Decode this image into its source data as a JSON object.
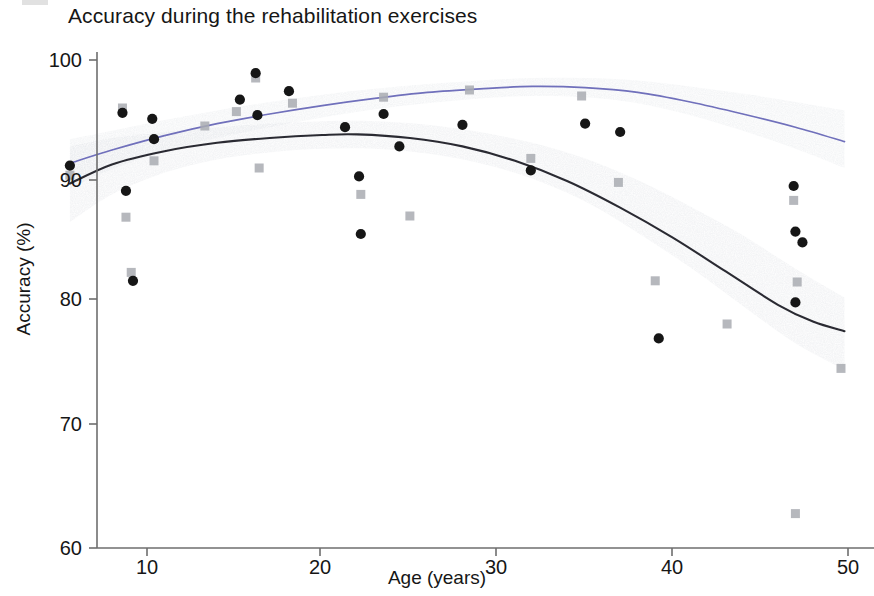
{
  "figure": {
    "title": "Accuracy during the rehabilitation exercises",
    "background_color": "#ffffff"
  },
  "axes": {
    "x_label": "Age (years)",
    "y_label": "Accuracy (%)",
    "x_ticks": [
      "10",
      "20",
      "30",
      "40",
      "50"
    ],
    "y_ticks": [
      "100",
      "90",
      "80",
      "70",
      "60"
    ]
  },
  "colors": {
    "curve_primary": "#2b2b33",
    "curve_secondary": "#6f6fbb",
    "band_fill": "#dfe2e6",
    "marker_circle": "#141414",
    "marker_square": "#a9acb1",
    "axis": "#6e6e6e"
  },
  "chart_data": {
    "type": "scatter",
    "title": "Accuracy during the rehabilitation exercises",
    "xlabel": "Age (years)",
    "ylabel": "Accuracy (%)",
    "xlim": [
      5,
      50.5
    ],
    "ylim": [
      60,
      101
    ],
    "x_ticks": [
      10,
      20,
      30,
      40,
      50
    ],
    "y_ticks": [
      60,
      70,
      80,
      90,
      100
    ],
    "grid": false,
    "legend": "none",
    "series": [
      {
        "name": "Group A (circles)",
        "marker": "circle",
        "color": "#141414",
        "points": [
          [
            5.6,
            91.2
          ],
          [
            8.6,
            95.6
          ],
          [
            8.8,
            89.1
          ],
          [
            9.2,
            81.6
          ],
          [
            10.3,
            95.1
          ],
          [
            10.4,
            93.4
          ],
          [
            15.3,
            96.7
          ],
          [
            16.2,
            98.9
          ],
          [
            16.3,
            95.4
          ],
          [
            18.1,
            97.4
          ],
          [
            21.3,
            94.4
          ],
          [
            22.1,
            90.3
          ],
          [
            22.2,
            85.5
          ],
          [
            23.5,
            95.5
          ],
          [
            24.4,
            92.8
          ],
          [
            28.0,
            94.6
          ],
          [
            31.9,
            90.8
          ],
          [
            35.0,
            94.7
          ],
          [
            37.0,
            94.0
          ],
          [
            39.2,
            76.8
          ],
          [
            46.9,
            89.5
          ],
          [
            47.0,
            85.7
          ],
          [
            47.4,
            84.8
          ],
          [
            47.0,
            79.8
          ]
        ]
      },
      {
        "name": "Group B (squares)",
        "marker": "square",
        "color": "#a9acb1",
        "points": [
          [
            5.6,
            90.4
          ],
          [
            8.6,
            96.0
          ],
          [
            8.8,
            86.9
          ],
          [
            9.1,
            82.3
          ],
          [
            10.4,
            91.6
          ],
          [
            13.3,
            94.5
          ],
          [
            15.1,
            95.7
          ],
          [
            16.2,
            98.5
          ],
          [
            16.4,
            91.0
          ],
          [
            18.3,
            96.4
          ],
          [
            22.2,
            88.8
          ],
          [
            23.5,
            96.9
          ],
          [
            25.0,
            87.0
          ],
          [
            28.4,
            97.5
          ],
          [
            31.9,
            91.8
          ],
          [
            34.8,
            97.0
          ],
          [
            36.9,
            89.8
          ],
          [
            39.0,
            81.6
          ],
          [
            43.1,
            78.0
          ],
          [
            46.9,
            88.3
          ],
          [
            47.1,
            81.5
          ],
          [
            49.6,
            74.3
          ],
          [
            47.0,
            62.2
          ]
        ]
      }
    ],
    "fits": [
      {
        "name": "Primary fit (quadratic)",
        "color": "#2b2b33",
        "points": [
          [
            5.6,
            89.7
          ],
          [
            8,
            91.3
          ],
          [
            11,
            92.4
          ],
          [
            14,
            93.1
          ],
          [
            17,
            93.5
          ],
          [
            20,
            93.75
          ],
          [
            22,
            93.8
          ],
          [
            25,
            93.5
          ],
          [
            28,
            92.8
          ],
          [
            31,
            91.6
          ],
          [
            34,
            89.9
          ],
          [
            37,
            87.7
          ],
          [
            40,
            85.2
          ],
          [
            43,
            82.4
          ],
          [
            46,
            79.6
          ],
          [
            48,
            78.2
          ],
          [
            49.8,
            77.4
          ]
        ],
        "band_upper": [
          [
            5.6,
            92.8
          ],
          [
            8,
            93.5
          ],
          [
            11,
            94.0
          ],
          [
            14,
            94.4
          ],
          [
            17,
            94.7
          ],
          [
            20,
            94.9
          ],
          [
            23,
            94.9
          ],
          [
            26,
            94.6
          ],
          [
            29,
            94.0
          ],
          [
            32,
            93.1
          ],
          [
            35,
            91.8
          ],
          [
            38,
            90.0
          ],
          [
            41,
            87.8
          ],
          [
            44,
            85.4
          ],
          [
            47,
            82.6
          ],
          [
            49.8,
            80.2
          ]
        ],
        "band_lower": [
          [
            5.6,
            86.5
          ],
          [
            8,
            88.8
          ],
          [
            11,
            90.6
          ],
          [
            14,
            91.7
          ],
          [
            17,
            92.3
          ],
          [
            20,
            92.6
          ],
          [
            23,
            92.6
          ],
          [
            26,
            92.2
          ],
          [
            29,
            91.4
          ],
          [
            32,
            90.1
          ],
          [
            35,
            88.2
          ],
          [
            38,
            85.6
          ],
          [
            41,
            82.7
          ],
          [
            44,
            79.5
          ],
          [
            47,
            76.4
          ],
          [
            49.8,
            74.2
          ]
        ]
      },
      {
        "name": "Secondary fit (quadratic)",
        "color": "#6f6fbb",
        "points": [
          [
            5.6,
            91.4
          ],
          [
            8,
            92.5
          ],
          [
            11,
            93.7
          ],
          [
            14,
            94.7
          ],
          [
            17,
            95.5
          ],
          [
            20,
            96.2
          ],
          [
            23,
            96.8
          ],
          [
            26,
            97.3
          ],
          [
            29,
            97.6
          ],
          [
            32,
            97.8
          ],
          [
            35,
            97.7
          ],
          [
            38,
            97.3
          ],
          [
            41,
            96.5
          ],
          [
            44,
            95.5
          ],
          [
            47,
            94.4
          ],
          [
            49.8,
            93.2
          ]
        ],
        "band_upper": [
          [
            5.6,
            93.4
          ],
          [
            8,
            94.1
          ],
          [
            11,
            95.0
          ],
          [
            14,
            95.8
          ],
          [
            17,
            96.5
          ],
          [
            20,
            97.1
          ],
          [
            23,
            97.6
          ],
          [
            26,
            98.0
          ],
          [
            29,
            98.3
          ],
          [
            32,
            98.5
          ],
          [
            35,
            98.5
          ],
          [
            38,
            98.3
          ],
          [
            41,
            97.8
          ],
          [
            44,
            97.2
          ],
          [
            47,
            96.5
          ],
          [
            49.8,
            95.8
          ]
        ],
        "band_lower": [
          [
            5.6,
            89.3
          ],
          [
            8,
            90.9
          ],
          [
            11,
            92.4
          ],
          [
            14,
            93.5
          ],
          [
            17,
            94.4
          ],
          [
            20,
            95.2
          ],
          [
            23,
            95.9
          ],
          [
            26,
            96.4
          ],
          [
            29,
            96.8
          ],
          [
            32,
            97.0
          ],
          [
            35,
            96.9
          ],
          [
            38,
            96.4
          ],
          [
            41,
            95.4
          ],
          [
            44,
            94.1
          ],
          [
            47,
            92.6
          ],
          [
            49.8,
            91.0
          ]
        ]
      }
    ]
  }
}
